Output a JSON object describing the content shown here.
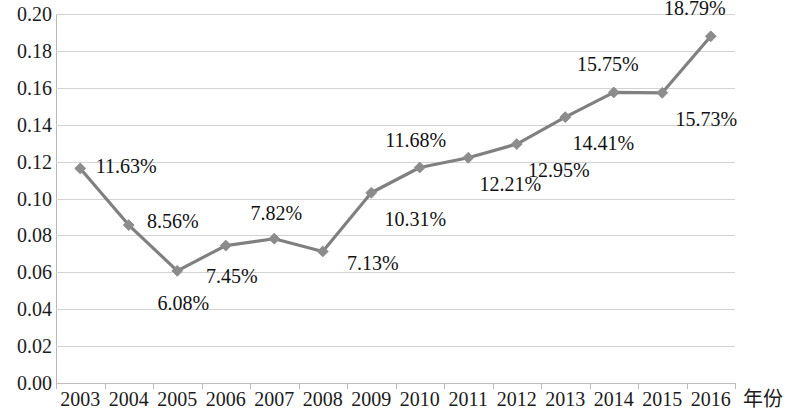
{
  "chart_data": {
    "type": "line",
    "title": "",
    "subtitle": "",
    "xlabel": "年份",
    "ylabel": "",
    "categories": [
      "2003",
      "2004",
      "2005",
      "2006",
      "2007",
      "2008",
      "2009",
      "2010",
      "2011",
      "2012",
      "2013",
      "2014",
      "2015",
      "2016"
    ],
    "values": [
      0.1163,
      0.0856,
      0.0608,
      0.0745,
      0.0782,
      0.0713,
      0.1031,
      0.1168,
      0.1221,
      0.1295,
      0.1441,
      0.1575,
      0.1573,
      0.1879
    ],
    "point_labels": [
      "11.63%",
      "8.56%",
      "6.08%",
      "7.45%",
      "7.82%",
      "7.13%",
      "10.31%",
      "11.68%",
      "12.21%",
      "12.95%",
      "14.41%",
      "15.75%",
      "15.73%",
      "18.79%"
    ],
    "ylim": [
      0.0,
      0.2
    ],
    "ytick_values": [
      0.2,
      0.18,
      0.16,
      0.14,
      0.12,
      0.1,
      0.08,
      0.06,
      0.04,
      0.02,
      0.0
    ],
    "ytick_labels": [
      "0.20",
      "0.18",
      "0.16",
      "0.14",
      "0.12",
      "0.10",
      "0.08",
      "0.06",
      "0.04",
      "0.02",
      "0.00"
    ],
    "grid": true,
    "legend": "none",
    "series_color": "#808080",
    "marker": "diamond",
    "marker_color": "#8c8c8c",
    "gridline_color": "#d3d3d3",
    "label_offsets": [
      {
        "dx": 46,
        "dy": -2
      },
      {
        "dx": 44,
        "dy": -4
      },
      {
        "dx": 6,
        "dy": 32
      },
      {
        "dx": 6,
        "dy": 30
      },
      {
        "dx": 2,
        "dy": -26
      },
      {
        "dx": 50,
        "dy": 12
      },
      {
        "dx": 44,
        "dy": 26
      },
      {
        "dx": -4,
        "dy": -28
      },
      {
        "dx": 42,
        "dy": 26
      },
      {
        "dx": 42,
        "dy": 26
      },
      {
        "dx": 38,
        "dy": 26
      },
      {
        "dx": -6,
        "dy": -28
      },
      {
        "dx": 44,
        "dy": 26
      },
      {
        "dx": -16,
        "dy": -28
      }
    ]
  }
}
